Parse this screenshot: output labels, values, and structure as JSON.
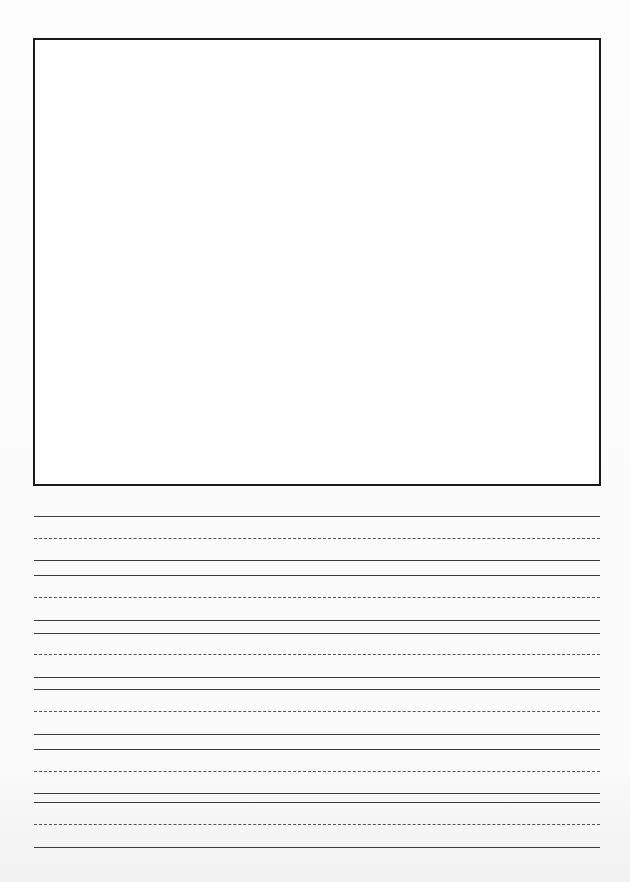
{
  "page": {
    "type": "handwriting practice sheet",
    "background": "#fcfcfc"
  },
  "drawing_box": {
    "label": "",
    "border_color": "#1a1a1a"
  },
  "writing_lines": {
    "group_count": 6,
    "line_color": "#3a3a3a",
    "groups": [
      {
        "top": 517,
        "mid": 539,
        "base": 561
      },
      {
        "top": 576,
        "mid": 598,
        "base": 621
      },
      {
        "top": 634,
        "mid": 655,
        "base": 678
      },
      {
        "top": 690,
        "mid": 712,
        "base": 735
      },
      {
        "top": 750,
        "mid": 772,
        "base": 794
      },
      {
        "top": 803,
        "mid": 825,
        "base": 848
      }
    ]
  }
}
